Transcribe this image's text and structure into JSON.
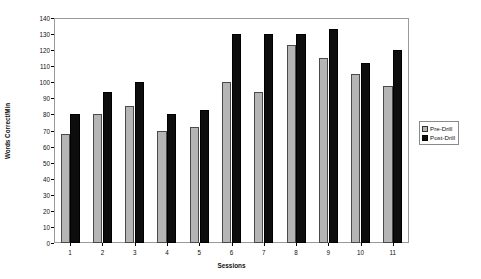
{
  "chart_data": {
    "type": "bar",
    "title": "",
    "xlabel": "Sessions",
    "ylabel": "Words Correct/Min",
    "categories": [
      "1",
      "2",
      "3",
      "4",
      "5",
      "6",
      "7",
      "8",
      "9",
      "10",
      "11"
    ],
    "series": [
      {
        "name": "Pre-Drill",
        "color": "#b5b5b5",
        "values": [
          68,
          80,
          85,
          70,
          72,
          100,
          94,
          123,
          115,
          105,
          98
        ]
      },
      {
        "name": "Post-Drill",
        "color": "#0d0d0d",
        "values": [
          80,
          94,
          100,
          80,
          83,
          130,
          130,
          130,
          133,
          112,
          120
        ]
      }
    ],
    "ylim": [
      0,
      140
    ],
    "yticks": [
      0,
      10,
      20,
      30,
      40,
      50,
      60,
      70,
      80,
      90,
      100,
      110,
      120,
      130,
      140
    ],
    "grid": false,
    "legend_position": "right-outside"
  },
  "legend": {
    "entries": [
      {
        "label": "Pre-Drill"
      },
      {
        "label": "Post-Drill"
      }
    ]
  },
  "axes": {
    "x_title": "Sessions",
    "y_title": "Words Correct/Min"
  }
}
